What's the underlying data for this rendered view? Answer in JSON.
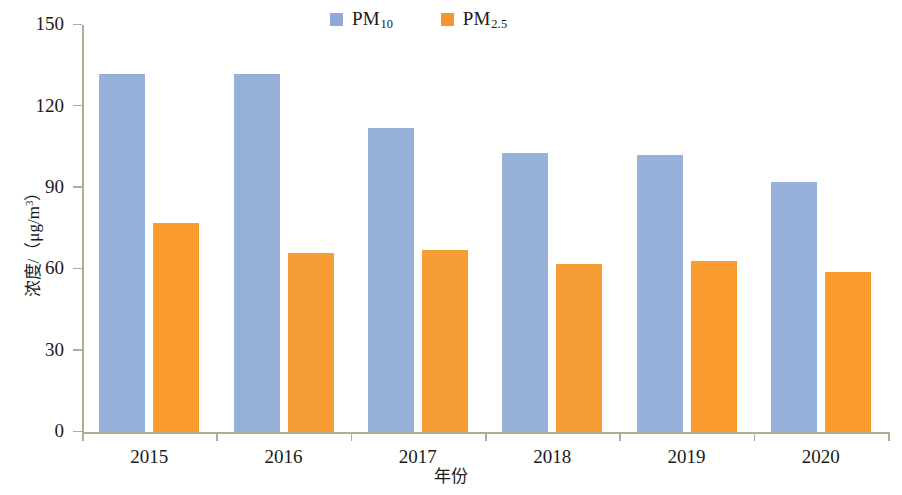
{
  "legend": {
    "position": "top-center",
    "entries": [
      {
        "name": "pm10",
        "label_main": "PM",
        "label_sub": "10",
        "color": "#8faad4"
      },
      {
        "name": "pm25",
        "label_main": "PM",
        "label_sub": "2.5",
        "color": "#f5962a"
      }
    ]
  },
  "axes": {
    "y_title_main": "浓度/（μg/m",
    "y_title_sup": "3",
    "y_title_tail": "）",
    "x_title": "年份",
    "y_ticks": [
      "0",
      "30",
      "60",
      "90",
      "120",
      "150"
    ]
  },
  "chart_data": {
    "type": "bar",
    "title": "",
    "xlabel": "年份",
    "ylabel": "浓度/（μg/m³）",
    "categories": [
      "2015",
      "2016",
      "2017",
      "2018",
      "2019",
      "2020"
    ],
    "series": [
      {
        "name": "PM10",
        "color": "#8faad4",
        "values": [
          132,
          132,
          112,
          103,
          102,
          92
        ]
      },
      {
        "name": "PM2.5",
        "color": "#f5962a",
        "values": [
          77,
          66,
          67,
          62,
          63,
          59
        ]
      }
    ],
    "ylim": [
      0,
      150
    ],
    "ytick_step": 30,
    "grid": false,
    "legend_position": "top-center",
    "units": "μg/m³"
  }
}
